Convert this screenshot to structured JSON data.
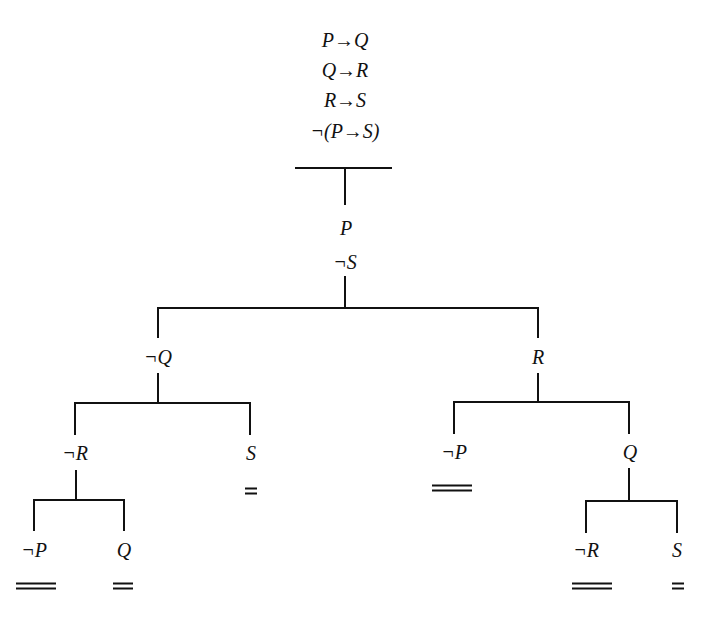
{
  "diagram": {
    "type": "truth-tree",
    "premises": [
      "P→Q",
      "Q→R",
      "R→S",
      "¬(P→S)"
    ],
    "trunk": [
      "P",
      "¬S"
    ],
    "branches": {
      "left": {
        "label": "¬Q",
        "children": {
          "left": {
            "label": "¬R",
            "children": {
              "left": {
                "label": "¬P",
                "closure": "≡"
              },
              "right": {
                "label": "Q",
                "closure": "="
              }
            }
          },
          "right": {
            "label": "S",
            "closure": "="
          }
        }
      },
      "right": {
        "label": "R",
        "children": {
          "left": {
            "label": "¬P",
            "closure": "≡"
          },
          "right": {
            "label": "Q",
            "children": {
              "left": {
                "label": "¬R",
                "closure": "≡"
              },
              "right": {
                "label": "S",
                "closure": "="
              }
            }
          }
        }
      }
    }
  }
}
